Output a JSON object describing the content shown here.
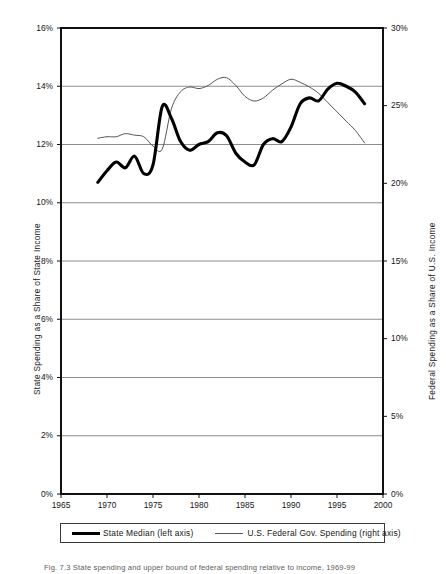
{
  "figure": {
    "caption_label": "Fig. 7.3",
    "caption_text": "State spending and upper bound of federal spending relative to income, 1969-99"
  },
  "axes": {
    "left_title": "State Spending  as a Share of State Income",
    "right_title": "Federal Spending  as a Share of U.S.  Income",
    "left_ticks": [
      "0%",
      "2%",
      "4%",
      "6%",
      "8%",
      "10%",
      "12%",
      "14%",
      "16%"
    ],
    "right_ticks": [
      "0%",
      "5%",
      "10%",
      "15%",
      "20%",
      "25%",
      "30%"
    ],
    "x_ticks": [
      "1965",
      "1970",
      "1975",
      "1980",
      "1985",
      "1990",
      "1995",
      "2000"
    ]
  },
  "legend": {
    "items": [
      {
        "label": "State Median (left axis)",
        "style": "thick",
        "color": "#000000"
      },
      {
        "label": "U.S. Federal Gov. Spending  (right axis)",
        "style": "thin",
        "color": "#555555"
      }
    ]
  },
  "chart_data": {
    "type": "line",
    "title": "",
    "xlabel": "",
    "ylabel": "State Spending  as a Share of State Income",
    "y2label": "Federal Spending  as a Share of U.S.  Income",
    "xlim": [
      1965,
      2000
    ],
    "ylim": [
      0,
      16
    ],
    "y2lim": [
      0,
      30
    ],
    "grid": true,
    "grid_axis": "y",
    "legend_position": "bottom",
    "x": [
      1969,
      1970,
      1971,
      1972,
      1973,
      1974,
      1975,
      1976,
      1977,
      1978,
      1979,
      1980,
      1981,
      1982,
      1983,
      1984,
      1985,
      1986,
      1987,
      1988,
      1989,
      1990,
      1991,
      1992,
      1993,
      1994,
      1995,
      1996,
      1997,
      1998
    ],
    "series": [
      {
        "name": "State Median (left axis)",
        "axis": "left",
        "unit": "%",
        "color": "#000000",
        "width": "thick",
        "values": [
          10.7,
          11.1,
          11.4,
          11.2,
          11.6,
          11.0,
          11.3,
          13.3,
          12.9,
          12.1,
          11.8,
          12.0,
          12.1,
          12.4,
          12.3,
          11.7,
          11.4,
          11.3,
          12.0,
          12.2,
          12.1,
          12.6,
          13.4,
          13.6,
          13.5,
          13.9,
          14.1,
          14.0,
          13.8,
          13.4
        ]
      },
      {
        "name": "U.S. Federal Gov. Spending  (right axis)",
        "axis": "right",
        "unit": "%",
        "color": "#555555",
        "width": "thin",
        "values": [
          22.9,
          23.0,
          23.0,
          23.2,
          23.1,
          23.0,
          22.4,
          22.2,
          24.8,
          25.9,
          26.2,
          26.1,
          26.3,
          26.7,
          26.8,
          26.3,
          25.6,
          25.3,
          25.5,
          26.0,
          26.4,
          26.7,
          26.5,
          26.2,
          25.8,
          25.2,
          24.6,
          24.0,
          23.4,
          22.6
        ]
      }
    ]
  }
}
